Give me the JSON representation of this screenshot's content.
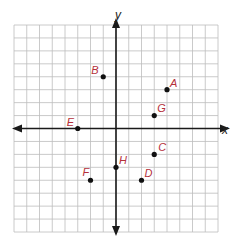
{
  "chart_data": {
    "type": "scatter",
    "title": "",
    "xlabel": "x",
    "ylabel": "y",
    "xlim": [
      -8,
      8
    ],
    "ylim": [
      -8,
      8
    ],
    "grid": true,
    "grid_step": 1,
    "tick_labels_shown": false,
    "points": [
      {
        "label": "A",
        "x": 4,
        "y": 3
      },
      {
        "label": "B",
        "x": -1,
        "y": 4
      },
      {
        "label": "C",
        "x": 3,
        "y": -2
      },
      {
        "label": "D",
        "x": 2,
        "y": -4
      },
      {
        "label": "E",
        "x": -3,
        "y": 0
      },
      {
        "label": "F",
        "x": -2,
        "y": -4
      },
      {
        "label": "G",
        "x": 3,
        "y": 1
      },
      {
        "label": "H",
        "x": 0,
        "y": -3
      }
    ],
    "label_offsets": {
      "A": [
        3,
        -3
      ],
      "B": [
        -12,
        -3
      ],
      "C": [
        4,
        -3
      ],
      "D": [
        3,
        -3
      ],
      "E": [
        -11,
        -3
      ],
      "F": [
        -8,
        -4
      ],
      "G": [
        3,
        -4
      ],
      "H": [
        3,
        -3
      ]
    }
  },
  "colors": {
    "grid": "#bdbdbd",
    "axis": "#1a1a1a",
    "point": "#111111",
    "label": "#b5303a"
  }
}
